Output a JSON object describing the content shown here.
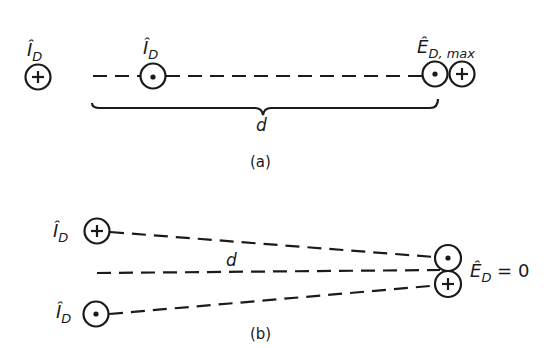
{
  "diagram": {
    "panel_a": {
      "caption": "(a)",
      "left_conductor": {
        "label_main": "Î",
        "label_sub": "D",
        "symbol": "cross-into-page"
      },
      "middle_conductor": {
        "label_main": "Î",
        "label_sub": "D",
        "symbol": "dot-out-of-page"
      },
      "field_point": {
        "label_main": "Ê",
        "label_sub": "D, max"
      },
      "distance_label": "d"
    },
    "panel_b": {
      "caption": "(b)",
      "top_conductor": {
        "label_main": "Î",
        "label_sub": "D",
        "symbol": "cross-into-page"
      },
      "bottom_conductor": {
        "label_main": "Î",
        "label_sub": "D",
        "symbol": "dot-out-of-page"
      },
      "field_point": {
        "label_main": "Ê",
        "label_sub": "D",
        "label_suffix": " = 0"
      },
      "distance_label": "d"
    }
  }
}
